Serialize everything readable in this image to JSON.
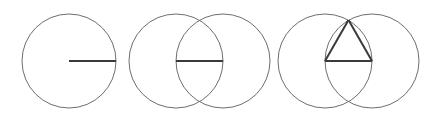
{
  "diagram": {
    "colors": {
      "circle": "#6e6e6e",
      "segment": "#3a3a3a",
      "background": "#ffffff"
    },
    "panels": [
      {
        "step": 1,
        "circles": [
          {
            "cx": 69,
            "cy": 61,
            "r": 47
          }
        ],
        "segments": [
          {
            "x1": 69,
            "y1": 61,
            "x2": 116,
            "y2": 61
          }
        ]
      },
      {
        "step": 2,
        "circles": [
          {
            "cx": 176,
            "cy": 61,
            "r": 47
          },
          {
            "cx": 223,
            "cy": 61,
            "r": 47
          }
        ],
        "segments": [
          {
            "x1": 176,
            "y1": 61,
            "x2": 223,
            "y2": 61
          }
        ]
      },
      {
        "step": 3,
        "circles": [
          {
            "cx": 325,
            "cy": 61,
            "r": 47
          },
          {
            "cx": 372,
            "cy": 61,
            "r": 47
          }
        ],
        "segments": [
          {
            "x1": 325,
            "y1": 61,
            "x2": 372,
            "y2": 61
          },
          {
            "x1": 325,
            "y1": 61,
            "x2": 348.5,
            "y2": 20
          },
          {
            "x1": 372,
            "y1": 61,
            "x2": 348.5,
            "y2": 20
          }
        ]
      }
    ]
  }
}
